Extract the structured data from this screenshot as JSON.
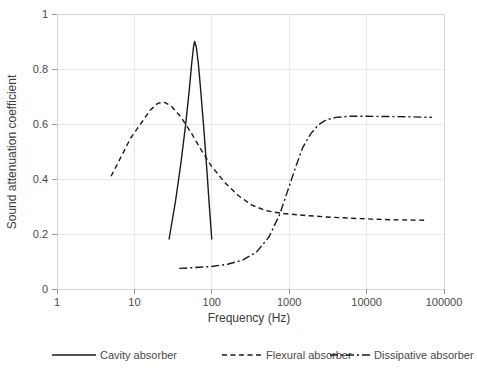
{
  "chart_data": {
    "type": "line",
    "title": "",
    "xlabel": "Frequency (Hz)",
    "ylabel": "Sound attenuation coefficient",
    "xscale": "log",
    "xlim": [
      1,
      100000
    ],
    "ylim": [
      0,
      1
    ],
    "grid": true,
    "legend_position": "bottom",
    "xticks": [
      1,
      10,
      100,
      1000,
      10000,
      100000
    ],
    "xtick_labels": [
      "1",
      "10",
      "100",
      "1000",
      "10000",
      "100000"
    ],
    "yticks": [
      0,
      0.2,
      0.4,
      0.6,
      0.8,
      1
    ],
    "ytick_labels": [
      "0",
      "0.2",
      "0.4",
      "0.6",
      "0.8",
      "1"
    ],
    "series": [
      {
        "name": "Cavity absorber",
        "linestyle": "solid",
        "color": "#1a1a1a",
        "points": [
          [
            28,
            0.18
          ],
          [
            34,
            0.32
          ],
          [
            40,
            0.46
          ],
          [
            46,
            0.6
          ],
          [
            51,
            0.72
          ],
          [
            55,
            0.82
          ],
          [
            58,
            0.88
          ],
          [
            60,
            0.9
          ],
          [
            63,
            0.88
          ],
          [
            67,
            0.82
          ],
          [
            72,
            0.72
          ],
          [
            79,
            0.58
          ],
          [
            86,
            0.44
          ],
          [
            93,
            0.3
          ],
          [
            100,
            0.18
          ]
        ]
      },
      {
        "name": "Flexural absorber",
        "linestyle": "dashed",
        "color": "#1a1a1a",
        "points": [
          [
            5,
            0.41
          ],
          [
            7,
            0.49
          ],
          [
            9,
            0.55
          ],
          [
            12,
            0.6
          ],
          [
            16,
            0.65
          ],
          [
            20,
            0.675
          ],
          [
            24,
            0.68
          ],
          [
            30,
            0.665
          ],
          [
            40,
            0.625
          ],
          [
            55,
            0.565
          ],
          [
            75,
            0.5
          ],
          [
            100,
            0.445
          ],
          [
            150,
            0.385
          ],
          [
            220,
            0.34
          ],
          [
            330,
            0.305
          ],
          [
            500,
            0.285
          ],
          [
            800,
            0.275
          ],
          [
            1500,
            0.268
          ],
          [
            3000,
            0.262
          ],
          [
            8000,
            0.256
          ],
          [
            20000,
            0.252
          ],
          [
            60000,
            0.25
          ]
        ]
      },
      {
        "name": "Dissipative absorber",
        "linestyle": "dashdot",
        "color": "#1a1a1a",
        "points": [
          [
            38,
            0.075
          ],
          [
            60,
            0.078
          ],
          [
            100,
            0.082
          ],
          [
            160,
            0.09
          ],
          [
            250,
            0.105
          ],
          [
            380,
            0.135
          ],
          [
            550,
            0.19
          ],
          [
            750,
            0.27
          ],
          [
            950,
            0.355
          ],
          [
            1200,
            0.44
          ],
          [
            1500,
            0.515
          ],
          [
            1900,
            0.565
          ],
          [
            2400,
            0.598
          ],
          [
            3000,
            0.615
          ],
          [
            4000,
            0.624
          ],
          [
            6000,
            0.628
          ],
          [
            10000,
            0.628
          ],
          [
            20000,
            0.627
          ],
          [
            40000,
            0.626
          ],
          [
            70000,
            0.624
          ]
        ]
      }
    ]
  },
  "legend": {
    "items": [
      {
        "label": "Cavity absorber",
        "linestyle": "solid"
      },
      {
        "label": "Flexural absorber",
        "linestyle": "dashed"
      },
      {
        "label": "Dissipative absorber",
        "linestyle": "dashdot"
      }
    ]
  }
}
